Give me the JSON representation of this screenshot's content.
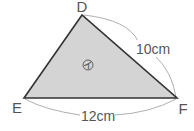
{
  "diagram": {
    "type": "triangle",
    "vertices": {
      "top": "D",
      "left": "E",
      "right": "F"
    },
    "fill_color": "#d4d4d4",
    "edge_color": "#333333",
    "bracket_color": "#b0b0b0",
    "label_color": "#555555",
    "measurements": [
      {
        "side": "DF",
        "label": "10cm"
      },
      {
        "side": "EF",
        "label": "12cm"
      }
    ],
    "region_label": "イ"
  }
}
